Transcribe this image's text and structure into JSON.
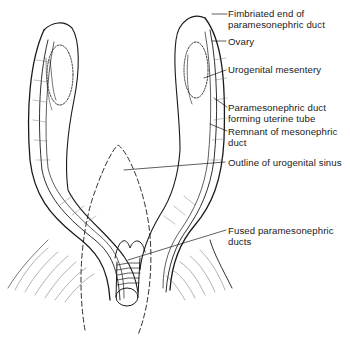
{
  "diagram": {
    "colors": {
      "ink": "#1a1a1a",
      "background": "#ffffff"
    },
    "labels": [
      {
        "id": "fimbriated-end",
        "text": "Fimbriated end of\nparamesonephric duct"
      },
      {
        "id": "ovary",
        "text": "Ovary"
      },
      {
        "id": "urogenital-mesentery",
        "text": "Urogenital mesentery"
      },
      {
        "id": "paramesonephric-duct-uterine-tube",
        "text": "Paramesonephric duct\nforming uterine tube"
      },
      {
        "id": "mesonephric-remnant",
        "text": "Remnant of mesonephric\nduct"
      },
      {
        "id": "urogenital-sinus-outline",
        "text": "Outline of urogenital sinus"
      },
      {
        "id": "fused-paramesonephric-ducts",
        "text": "Fused paramesonephric\nducts"
      }
    ]
  }
}
